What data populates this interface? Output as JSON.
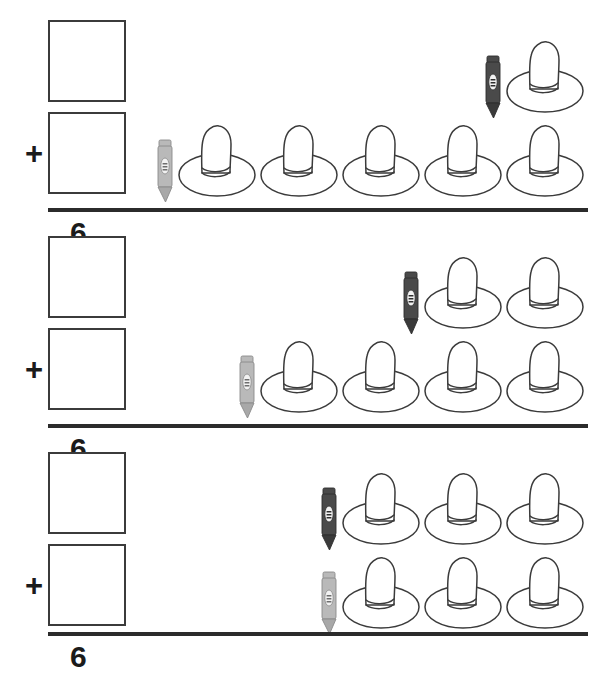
{
  "worksheet": {
    "title": "Addition with pictures worksheet",
    "object_name": "hat",
    "marker_name": "crayon",
    "operator": "+",
    "colors": {
      "outline": "#3b3b3b",
      "rule_line": "#2b2b2b",
      "digit": "#1b1b1b",
      "crayon_dark": "#4a4a4a",
      "crayon_dark_tip": "#3a3a3a",
      "crayon_light": "#b9b9b9",
      "crayon_light_tip": "#a8a8a8",
      "hat_fill": "#ffffff",
      "page_background": "#ffffff"
    },
    "problems": [
      {
        "id": "problem-1",
        "top": {
          "count": 1,
          "marker_color": "dark",
          "addend_label": ""
        },
        "bottom": {
          "count": 5,
          "marker_color": "light",
          "addend_label": ""
        },
        "operator": "+",
        "sum": "6",
        "top_box_value": "",
        "bottom_box_value": ""
      },
      {
        "id": "problem-2",
        "top": {
          "count": 2,
          "marker_color": "dark",
          "addend_label": ""
        },
        "bottom": {
          "count": 4,
          "marker_color": "light",
          "addend_label": ""
        },
        "operator": "+",
        "sum": "6",
        "top_box_value": "",
        "bottom_box_value": ""
      },
      {
        "id": "problem-3",
        "top": {
          "count": 3,
          "marker_color": "dark",
          "addend_label": ""
        },
        "bottom": {
          "count": 3,
          "marker_color": "light",
          "addend_label": ""
        },
        "operator": "+",
        "sum": "6",
        "top_box_value": "",
        "bottom_box_value": ""
      }
    ]
  }
}
